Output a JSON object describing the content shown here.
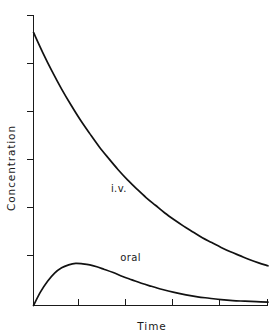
{
  "chart_data": {
    "type": "line",
    "title": "",
    "xlabel": "Time",
    "ylabel": "Concentration",
    "grid": false,
    "legend_position": "inline-annotation",
    "axis_style": "open-left-bottom",
    "xlim": [
      0,
      10
    ],
    "ylim": [
      0,
      6
    ],
    "x_tick_labels": [
      "",
      "",
      "",
      "",
      "",
      ""
    ],
    "y_tick_labels": [
      "",
      "",
      "",
      "",
      "",
      ""
    ],
    "x_tick_count": 6,
    "y_tick_count": 6,
    "series": [
      {
        "name": "i.v.",
        "label": "i.v.",
        "color": "#111111",
        "x": [
          0.0,
          0.4,
          0.8,
          1.2,
          1.6,
          2.0,
          2.4,
          2.8,
          3.2,
          3.6,
          4.0,
          4.4,
          4.8,
          5.2,
          5.6,
          6.0,
          6.4,
          6.8,
          7.2,
          7.6,
          8.0,
          8.4,
          8.8,
          9.2,
          9.6,
          10.0
        ],
        "y": [
          5.64,
          5.22,
          4.83,
          4.47,
          4.14,
          3.83,
          3.55,
          3.28,
          3.04,
          2.81,
          2.6,
          2.41,
          2.23,
          2.07,
          1.91,
          1.77,
          1.64,
          1.52,
          1.4,
          1.3,
          1.2,
          1.11,
          1.03,
          0.95,
          0.88,
          0.82
        ]
      },
      {
        "name": "oral",
        "label": "oral",
        "color": "#111111",
        "x": [
          0.0,
          0.3,
          0.6,
          0.9,
          1.2,
          1.5,
          1.8,
          2.1,
          2.4,
          2.7,
          3.0,
          3.4,
          3.8,
          4.2,
          4.6,
          5.0,
          5.5,
          6.0,
          6.5,
          7.0,
          7.5,
          8.0,
          8.5,
          9.0,
          9.5,
          10.0
        ],
        "y": [
          0.0,
          0.28,
          0.5,
          0.67,
          0.78,
          0.84,
          0.87,
          0.86,
          0.84,
          0.8,
          0.75,
          0.68,
          0.6,
          0.53,
          0.46,
          0.4,
          0.33,
          0.27,
          0.22,
          0.18,
          0.15,
          0.12,
          0.1,
          0.09,
          0.08,
          0.07
        ]
      }
    ],
    "annotations": [
      {
        "text": "i.v.",
        "x": 3.3,
        "y": 2.35
      },
      {
        "text": "oral",
        "x": 3.7,
        "y": 0.92
      }
    ]
  }
}
